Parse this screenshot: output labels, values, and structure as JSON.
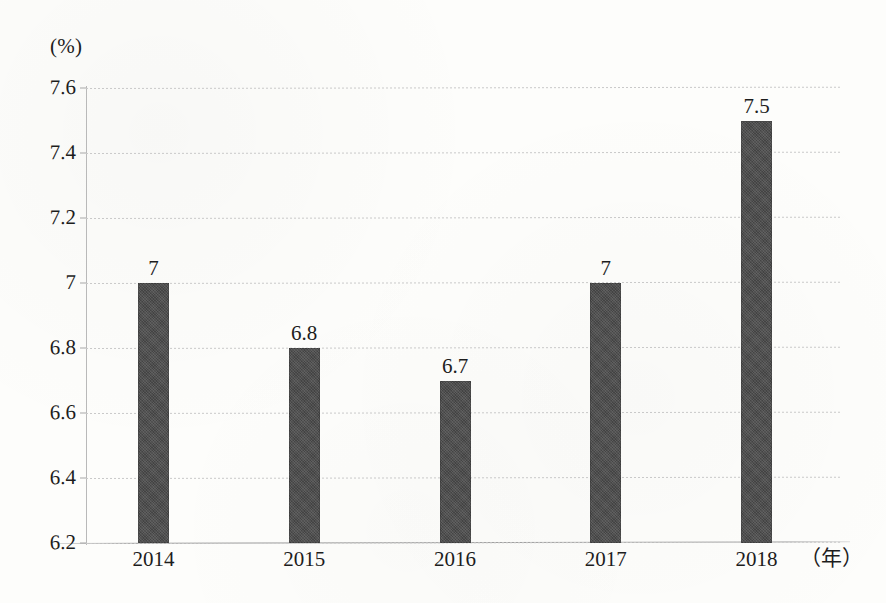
{
  "chart_data": {
    "type": "bar",
    "title": "",
    "subtitle": "",
    "xlabel": "（年）",
    "ylabel": "(%)",
    "categories": [
      "2014",
      "2015",
      "2016",
      "2017",
      "2018"
    ],
    "values": [
      7,
      6.8,
      6.7,
      7,
      7.5
    ],
    "value_labels": [
      "7",
      "6.8",
      "6.7",
      "7",
      "7.5"
    ],
    "ylim": [
      6.2,
      7.6
    ],
    "ytick_labels": [
      "7.6",
      "7.4",
      "7.2",
      "7",
      "6.8",
      "6.6",
      "6.4",
      "6.2"
    ],
    "ytick_values": [
      7.6,
      7.4,
      7.2,
      7,
      6.8,
      6.6,
      6.4,
      6.2
    ],
    "grid": true,
    "legend": null,
    "legend_position": "none",
    "series": [
      {
        "name": "",
        "values": [
          7,
          6.8,
          6.7,
          7,
          7.5
        ],
        "color": "#4a4a4a"
      }
    ],
    "colors": {
      "bar": "#4a4a4a",
      "gridline": "#c9c9c9",
      "axis": "#a5a5a5",
      "text": "#1d1d1d",
      "background": "#fdfdfb"
    }
  }
}
